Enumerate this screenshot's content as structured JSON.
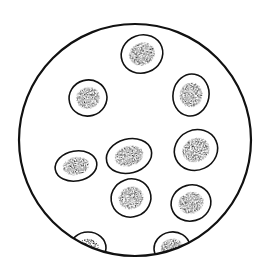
{
  "illustration": {
    "subject": "microscope field of view with oval cells",
    "background": "#ffffff",
    "ink": "#111111",
    "field": {
      "cx": 135,
      "cy": 140,
      "r": 116
    },
    "cells": [
      {
        "cx": 142,
        "cy": 54,
        "rx": 21,
        "ry": 19,
        "rot": -20,
        "full": true
      },
      {
        "cx": 88,
        "cy": 98,
        "rx": 19,
        "ry": 18,
        "rot": -15,
        "full": true
      },
      {
        "cx": 191,
        "cy": 95,
        "rx": 18,
        "ry": 21,
        "rot": 10,
        "full": true
      },
      {
        "cx": 76,
        "cy": 166,
        "rx": 21,
        "ry": 15,
        "rot": -10,
        "full": true
      },
      {
        "cx": 129,
        "cy": 156,
        "rx": 23,
        "ry": 17,
        "rot": -15,
        "full": true
      },
      {
        "cx": 196,
        "cy": 150,
        "rx": 22,
        "ry": 20,
        "rot": -25,
        "full": true
      },
      {
        "cx": 131,
        "cy": 198,
        "rx": 20,
        "ry": 19,
        "rot": -20,
        "full": true
      },
      {
        "cx": 191,
        "cy": 203,
        "rx": 20,
        "ry": 18,
        "rot": -15,
        "full": true
      },
      {
        "cx": 88,
        "cy": 248,
        "rx": 18,
        "ry": 16,
        "rot": 0,
        "full": false
      },
      {
        "cx": 172,
        "cy": 248,
        "rx": 18,
        "ry": 16,
        "rot": -10,
        "full": false
      }
    ]
  }
}
